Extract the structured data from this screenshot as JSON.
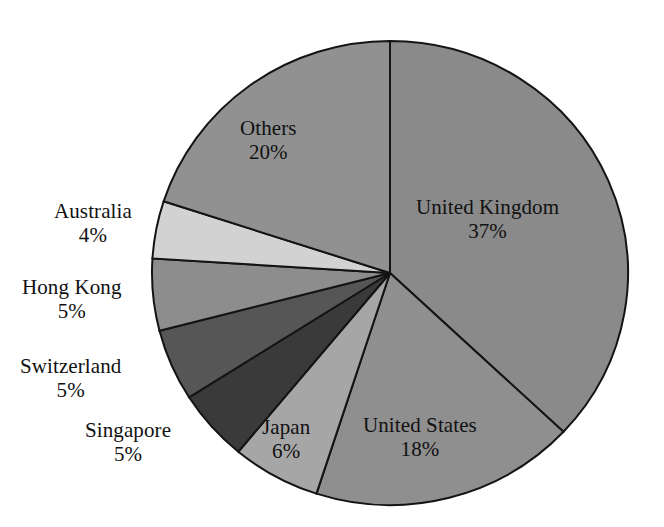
{
  "chart_data": {
    "type": "pie",
    "title": "",
    "subtitle": "",
    "xlabel": "",
    "ylabel": "",
    "legend_position": "none",
    "grid": false,
    "units": "percent",
    "start_angle_deg": 0,
    "direction": "clockwise",
    "categories": [
      "United Kingdom",
      "United States",
      "Japan",
      "Singapore",
      "Switzerland",
      "Hong Kong",
      "Australia",
      "Others"
    ],
    "values": [
      37,
      18,
      6,
      5,
      5,
      5,
      4,
      20
    ],
    "slices": [
      {
        "label": "United Kingdom",
        "value": 37,
        "value_label": "37%",
        "color": "#8a8a8a",
        "label_placement": "inside"
      },
      {
        "label": "United States",
        "value": 18,
        "value_label": "18%",
        "color": "#8f8f8f",
        "label_placement": "inside"
      },
      {
        "label": "Japan",
        "value": 6,
        "value_label": "6%",
        "color": "#a6a6a6",
        "label_placement": "inside"
      },
      {
        "label": "Singapore",
        "value": 5,
        "value_label": "5%",
        "color": "#3a3a3a",
        "label_placement": "outside"
      },
      {
        "label": "Switzerland",
        "value": 5,
        "value_label": "5%",
        "color": "#565656",
        "label_placement": "outside"
      },
      {
        "label": "Hong Kong",
        "value": 5,
        "value_label": "5%",
        "color": "#8d8d8d",
        "label_placement": "outside"
      },
      {
        "label": "Australia",
        "value": 4,
        "value_label": "4%",
        "color": "#d2d2d2",
        "label_placement": "outside"
      },
      {
        "label": "Others",
        "value": 20,
        "value_label": "20%",
        "color": "#919191",
        "label_placement": "inside"
      }
    ],
    "stroke_color": "#141414",
    "background_color": "#ffffff"
  },
  "labels": {
    "united_kingdom": {
      "name": "United Kingdom",
      "pct": "37%"
    },
    "united_states": {
      "name": "United States",
      "pct": "18%"
    },
    "japan": {
      "name": "Japan",
      "pct": "6%"
    },
    "singapore": {
      "name": "Singapore",
      "pct": "5%"
    },
    "switzerland": {
      "name": "Switzerland",
      "pct": "5%"
    },
    "hong_kong": {
      "name": "Hong Kong",
      "pct": "5%"
    },
    "australia": {
      "name": "Australia",
      "pct": "4%"
    },
    "others": {
      "name": "Others",
      "pct": "20%"
    }
  }
}
